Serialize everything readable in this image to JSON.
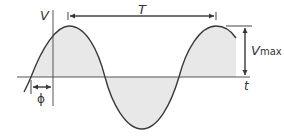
{
  "diagram": {
    "labels": {
      "voltage_axis": "V",
      "time_axis": "t",
      "period": "T",
      "amplitude_main": "V",
      "amplitude_sub": "max",
      "phase": "ϕ"
    },
    "colors": {
      "curve": "#3a3a3a",
      "fill": "#e6e6e6",
      "axis": "#555555"
    }
  }
}
